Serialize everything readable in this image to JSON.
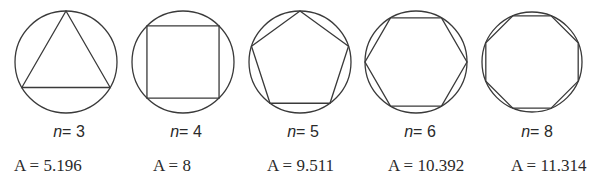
{
  "figure": {
    "circle_radius": 51,
    "items": [
      {
        "n_var": "n",
        "n_eq": "= 3",
        "n": 3,
        "area_label": "A = 5.196",
        "area": 5.196,
        "cx": 66,
        "rotation_deg": -90
      },
      {
        "n_var": "n",
        "n_eq": "= 4",
        "n": 4,
        "area_label": "A = 8",
        "area": 8,
        "cx": 183,
        "rotation_deg": -45
      },
      {
        "n_var": "n",
        "n_eq": "= 5",
        "n": 5,
        "area_label": "A = 9.511",
        "area": 9.511,
        "cx": 300,
        "rotation_deg": -90
      },
      {
        "n_var": "n",
        "n_eq": "= 6",
        "n": 6,
        "area_label": "A = 10.392",
        "area": 10.392,
        "cx": 416,
        "rotation_deg": 0
      },
      {
        "n_var": "n",
        "n_eq": "= 8",
        "n": 8,
        "area_label": "A = 11.314",
        "area": 11.314,
        "cx": 532,
        "rotation_deg": 22.5
      }
    ],
    "colors": {
      "stroke": "#3a3a3a",
      "text": "#2a2a2a",
      "background": "#ffffff"
    }
  }
}
